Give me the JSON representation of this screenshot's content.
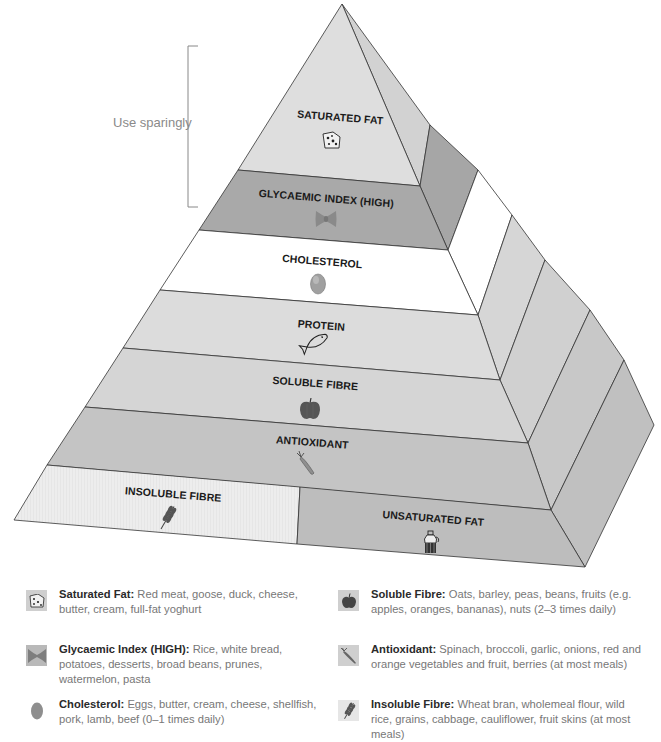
{
  "annotation": {
    "label": "Use sparingly"
  },
  "pyramid": {
    "layers": [
      {
        "id": "saturated-fat",
        "label": "SATURATED FAT",
        "icon": "cheese-icon",
        "fill": "#dedede"
      },
      {
        "id": "glycaemic-index",
        "label": "GLYCAEMIC INDEX (HIGH)",
        "icon": "pasta-bow-icon",
        "fill": "#a9a9a9"
      },
      {
        "id": "cholesterol",
        "label": "CHOLESTEROL",
        "icon": "egg-icon",
        "fill": "#ffffff"
      },
      {
        "id": "protein",
        "label": "PROTEIN",
        "icon": "fish-icon",
        "fill": "#dcdcdc"
      },
      {
        "id": "soluble-fibre",
        "label": "SOLUBLE FIBRE",
        "icon": "apple-icon",
        "fill": "#d5d5d5"
      },
      {
        "id": "antioxidant",
        "label": "ANTIOXIDANT",
        "icon": "carrot-icon",
        "fill": "#c4c4c4"
      },
      {
        "id": "insoluble-fibre",
        "label": "INSOLUBLE FIBRE",
        "icon": "wheat-icon",
        "fill": "#ececec"
      },
      {
        "id": "unsaturated-fat",
        "label": "UNSATURATED FAT",
        "icon": "oil-bottle-icon",
        "fill": "#bdbdbd"
      }
    ]
  },
  "legend": {
    "items": [
      {
        "title": "Saturated Fat:",
        "text": " Red meat, goose, duck, cheese, butter, cream, full-fat yoghurt",
        "icon": "cheese-icon"
      },
      {
        "title": "Glycaemic Index (HIGH):",
        "text": " Rice, white bread, potatoes, desserts, broad beans, prunes, watermelon, pasta",
        "icon": "pasta-bow-icon"
      },
      {
        "title": "Cholesterol:",
        "text": " Eggs, butter, cream, cheese, shellfish, pork, lamb, beef (0–1 times daily)",
        "icon": "egg-icon"
      },
      {
        "title": "Soluble Fibre:",
        "text": " Oats, barley, peas, beans, fruits (e.g. apples, oranges, bananas), nuts (2–3 times daily)",
        "icon": "apple-icon"
      },
      {
        "title": "Antioxidant:",
        "text": " Spinach, broccoli, garlic, onions, red and orange vegetables and fruit, berries (at most meals)",
        "icon": "carrot-icon"
      },
      {
        "title": "Insoluble Fibre:",
        "text": " Wheat bran, wholemeal flour, wild rice, grains, cabbage, cauliflower, fruit skins (at most meals)",
        "icon": "wheat-icon"
      }
    ]
  }
}
